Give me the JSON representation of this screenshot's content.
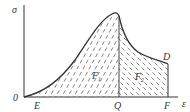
{
  "diagram": {
    "axis_labels": {
      "y": "σ",
      "x": "ε",
      "origin": "0"
    },
    "points": {
      "E": "E",
      "Q": "Q",
      "F": "F",
      "D": "D"
    },
    "regions": [
      {
        "label": "F",
        "subscript": "1"
      },
      {
        "label": "F",
        "subscript": "2"
      }
    ],
    "colors": {
      "line": "#333333",
      "hatch": "#555555",
      "background": "#ffffff"
    }
  }
}
